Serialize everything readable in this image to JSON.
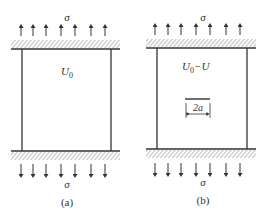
{
  "figure": {
    "panels": [
      {
        "id": "a",
        "caption": "(a)",
        "top_stress_label": "σ",
        "bottom_stress_label": "σ",
        "energy_label_main": "U",
        "energy_label_sub": "0",
        "arrow_count_top": 7,
        "arrow_count_bottom": 7
      },
      {
        "id": "b",
        "caption": "(b)",
        "top_stress_label": "σ",
        "bottom_stress_label": "σ",
        "energy_label_main": "U",
        "energy_label_sub": "0",
        "energy_label_suffix": "−U",
        "crack_label": "2a",
        "arrow_count_top": 7,
        "arrow_count_bottom": 7
      }
    ],
    "colors": {
      "line": "#333333",
      "hatch": "#888888",
      "text": "#333333"
    }
  }
}
